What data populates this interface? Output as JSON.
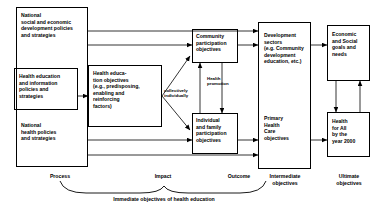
{
  "diagram": {
    "title": "Immediate objectives of health education",
    "boxes": {
      "national_socioeconomic": "National\nsocial and economic\ndevelopment policies\nand strategies",
      "health_education_policies": "Health education\nand information\npolicies and\nstrategies",
      "national_health_policies": "National\nhealth policies\nand strategies",
      "health_education_objectives": "Health educa-\ntion objectives\n(e.g., predisposing,\nenabling and\nreinforcing\nfactors)",
      "community_participation": "Community\nparticipation\nobjectives",
      "individual_family_participation": "Individual\nand family\nparticipation\nobjectives",
      "development_sectors": "Development\nsectors\n(e.g. Community\ndevelopment\neducation, etc.)",
      "primary_health_care": "Primary\nHealth\nCare\nobjectives",
      "economic_social_goals": "Economic\nand Social\ngoals and\nneeds",
      "health_for_all": "Health\nfor All\nby the\nyear 2000"
    },
    "edge_labels": {
      "collectively_individually": "collectively\nindividually",
      "health_promotion": "Health\npromotion"
    },
    "axis_labels": {
      "process": "Process",
      "impact": "Impact",
      "outcome": "Outcome",
      "intermediate_objectives": "Intermediate\nobjectives",
      "ultimate_objectives": "Ultimate\nobjectives"
    },
    "brace_caption": "Immediate objectives of health education",
    "colors": {
      "stroke": "#000000",
      "background": "#ffffff",
      "text": "#000000"
    }
  }
}
